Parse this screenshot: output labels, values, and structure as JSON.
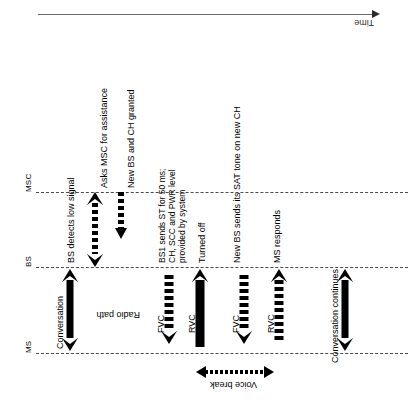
{
  "diagram": {
    "orientation": "rotated-90",
    "time_axis": {
      "label": "Time",
      "direction": "left-to-right"
    },
    "lanes": [
      {
        "id": "msc",
        "label": "MSC"
      },
      {
        "id": "bs",
        "label": "BS"
      },
      {
        "id": "ms",
        "label": "MS"
      }
    ],
    "annotations": [
      {
        "id": "bs-detects-low-signal",
        "text": "BS detects low signal"
      },
      {
        "id": "asks-msc",
        "text": "Asks MSC for assistance"
      },
      {
        "id": "new-bs-ch-granted",
        "text": "New BS and CH granted"
      },
      {
        "id": "bs1-sends-st",
        "text": "BS1 sends ST for 50 ms;\nCH, SCC and PWR level\nprovided by system"
      },
      {
        "id": "turned-off",
        "text": "Turned off"
      },
      {
        "id": "new-bs-sat-tone",
        "text": "New BS sends its SAT tone on new CH"
      },
      {
        "id": "ms-responds",
        "text": "MS responds"
      },
      {
        "id": "conversation",
        "text": "Conversation"
      },
      {
        "id": "radio-path",
        "text": "Radio path"
      },
      {
        "id": "conversation-continues",
        "text": "Conversation continues"
      },
      {
        "id": "voice-break",
        "text": "Voice break"
      }
    ],
    "channels": [
      {
        "id": "fvc-1",
        "label": "FVC"
      },
      {
        "id": "rvc-1",
        "label": "RVC"
      },
      {
        "id": "fvc-2",
        "label": "FVC"
      },
      {
        "id": "rvc-2",
        "label": "RVC"
      }
    ],
    "colors": {
      "ink": "#000000",
      "lane_rule": "#4a4a4a",
      "time_axis": "#6b6b6b",
      "background": "#ffffff"
    }
  }
}
